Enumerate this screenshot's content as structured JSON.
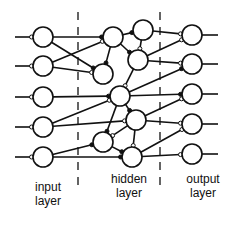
{
  "diagram": {
    "title": "",
    "labels": {
      "input": [
        "input",
        "layer"
      ],
      "hidden": [
        "hidden",
        "layer"
      ],
      "output": [
        "output",
        "layer"
      ]
    },
    "colors": {
      "stroke": "#111111",
      "background": "#ffffff"
    },
    "input_nodes": [
      {
        "id": "i1",
        "x": 43,
        "y": 37
      },
      {
        "id": "i2",
        "x": 43,
        "y": 66
      },
      {
        "id": "i3",
        "x": 43,
        "y": 97
      },
      {
        "id": "i4",
        "x": 43,
        "y": 127
      },
      {
        "id": "i5",
        "x": 43,
        "y": 157
      }
    ],
    "hidden_nodes": [
      {
        "id": "h1",
        "x": 113,
        "y": 37
      },
      {
        "id": "h2",
        "x": 143,
        "y": 30
      },
      {
        "id": "h3",
        "x": 103,
        "y": 74
      },
      {
        "id": "h4",
        "x": 138,
        "y": 60
      },
      {
        "id": "h5",
        "x": 120,
        "y": 96
      },
      {
        "id": "h6",
        "x": 136,
        "y": 120
      },
      {
        "id": "h7",
        "x": 103,
        "y": 142
      },
      {
        "id": "h8",
        "x": 132,
        "y": 157
      }
    ],
    "output_nodes": [
      {
        "id": "o1",
        "x": 192,
        "y": 35
      },
      {
        "id": "o2",
        "x": 192,
        "y": 64
      },
      {
        "id": "o3",
        "x": 192,
        "y": 94
      },
      {
        "id": "o4",
        "x": 192,
        "y": 124
      },
      {
        "id": "o5",
        "x": 192,
        "y": 154
      }
    ],
    "edges": [
      [
        "i1",
        "h1"
      ],
      [
        "i1",
        "h3"
      ],
      [
        "i2",
        "h1"
      ],
      [
        "i2",
        "h3"
      ],
      [
        "i3",
        "h5"
      ],
      [
        "i4",
        "h5"
      ],
      [
        "i4",
        "h6"
      ],
      [
        "i5",
        "h7"
      ],
      [
        "i5",
        "h8"
      ],
      [
        "h1",
        "h2"
      ],
      [
        "h1",
        "h4"
      ],
      [
        "h1",
        "h3"
      ],
      [
        "h2",
        "h4"
      ],
      [
        "h4",
        "h5"
      ],
      [
        "h5",
        "h6"
      ],
      [
        "h5",
        "h7"
      ],
      [
        "h6",
        "h7"
      ],
      [
        "h6",
        "h8"
      ],
      [
        "h7",
        "h8"
      ],
      [
        "h2",
        "o1"
      ],
      [
        "h4",
        "o1"
      ],
      [
        "h4",
        "o2"
      ],
      [
        "h5",
        "o2"
      ],
      [
        "h5",
        "o3"
      ],
      [
        "h6",
        "o3"
      ],
      [
        "h6",
        "o4"
      ],
      [
        "h8",
        "o4"
      ],
      [
        "h8",
        "o5"
      ]
    ],
    "dividers": [
      {
        "x": 78
      },
      {
        "x": 160
      }
    ]
  }
}
